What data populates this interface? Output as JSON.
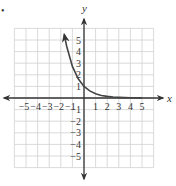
{
  "marker": "•",
  "chart_data": {
    "type": "line",
    "title": "",
    "xlabel": "x",
    "ylabel": "y",
    "function": "y = e^(-x)",
    "xlim": [
      -6,
      6
    ],
    "ylim": [
      -6,
      6
    ],
    "grid": true,
    "x_tick_labels": [
      "−5",
      "−4",
      "−3",
      "−2",
      "−1",
      "1",
      "2",
      "3",
      "4",
      "5"
    ],
    "y_tick_labels": [
      "5",
      "4",
      "3",
      "2",
      "1",
      "−1",
      "−2",
      "−3",
      "−4",
      "−5"
    ],
    "series": [
      {
        "name": "curve",
        "x": [
          -1.7,
          -1.5,
          -1.0,
          -0.5,
          0,
          0.5,
          1,
          1.5,
          2,
          2.5,
          3,
          3.5,
          4,
          4.5,
          5
        ],
        "y": [
          5.47,
          4.48,
          2.72,
          1.65,
          1.0,
          0.61,
          0.37,
          0.22,
          0.14,
          0.08,
          0.05,
          0.03,
          0.02,
          0.01,
          0.01
        ]
      }
    ],
    "colors": {
      "curve": "#444444",
      "axes": "#333333",
      "grid": "#d0d0d0"
    }
  }
}
